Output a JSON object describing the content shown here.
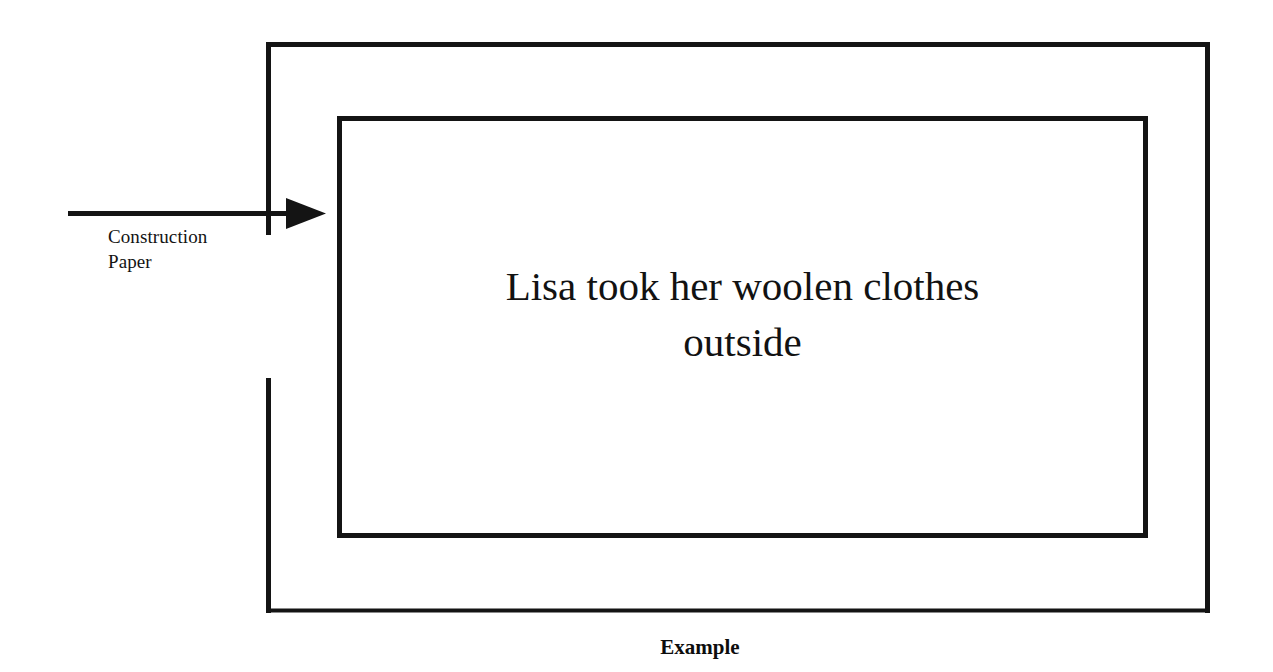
{
  "diagram": {
    "stroke_color": "#141414",
    "background_color": "#ffffff",
    "outer_box": {
      "name": "outer-frame",
      "x": 266,
      "y": 42,
      "width": 944,
      "height": 571,
      "stroke_width": 5,
      "left_edge_gap": {
        "from_y": 235,
        "to_y": 378
      }
    },
    "inner_box": {
      "name": "inner-frame",
      "x": 337,
      "y": 116,
      "width": 810,
      "height": 422,
      "stroke_width": 5
    },
    "arrow": {
      "name": "construction-paper-arrow",
      "from_x": 68,
      "to_x": 326,
      "y": 213,
      "stroke_width": 5,
      "head_width": 40,
      "head_height": 30,
      "direction": "right"
    },
    "arrow_label": "Construction\nPaper",
    "inner_text_line_1": "Lisa took her woolen clothes",
    "inner_text_line_2": "outside",
    "caption": "Example"
  }
}
